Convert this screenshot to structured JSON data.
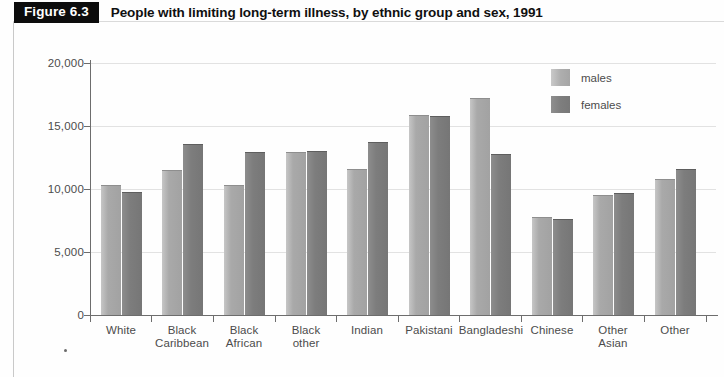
{
  "figure": {
    "tag": "Figure 6.3",
    "title": "People with limiting long-term illness, by ethnic group and sex, 1991"
  },
  "legend": {
    "items": [
      {
        "label": "males",
        "color": "#a9a9a9"
      },
      {
        "label": "females",
        "color": "#7d7d7d"
      }
    ]
  },
  "chart_data": {
    "type": "bar",
    "title": "People with limiting long-term illness, by ethnic group and sex, 1991",
    "xlabel": "",
    "ylabel": "",
    "ylim": [
      0,
      20000
    ],
    "yticks": [
      0,
      5000,
      10000,
      15000,
      20000
    ],
    "ytick_labels": [
      "0",
      "5,000",
      "10,000",
      "15,000",
      "20,000"
    ],
    "grid": true,
    "legend_position": "top-right",
    "categories": [
      "White",
      "Black Caribbean",
      "Black African",
      "Black other",
      "Indian",
      "Pakistani",
      "Bangladeshi",
      "Chinese",
      "Other Asian",
      "Other"
    ],
    "category_lines": [
      [
        "White"
      ],
      [
        "Black",
        "Caribbean"
      ],
      [
        "Black",
        "African"
      ],
      [
        "Black",
        "other"
      ],
      [
        "Indian"
      ],
      [
        "Pakistani"
      ],
      [
        "Bangladeshi"
      ],
      [
        "Chinese"
      ],
      [
        "Other",
        "Asian"
      ],
      [
        "Other"
      ]
    ],
    "series": [
      {
        "name": "males",
        "color": "#a9a9a9",
        "values": [
          10300,
          11500,
          10300,
          12900,
          11600,
          15900,
          17200,
          7800,
          9500,
          10800
        ]
      },
      {
        "name": "females",
        "color": "#7d7d7d",
        "values": [
          9800,
          13600,
          12900,
          13000,
          13700,
          15800,
          12800,
          7600,
          9700,
          11600
        ]
      }
    ]
  }
}
